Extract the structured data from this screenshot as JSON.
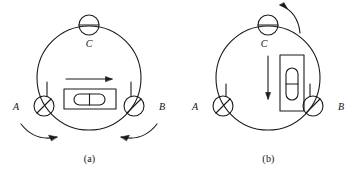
{
  "figure": {
    "type": "technical-diagram",
    "panels": [
      {
        "id": "a",
        "caption": "(a)",
        "footscrews": [
          {
            "label": "A",
            "position": "lower-left",
            "slot": "diagonal"
          },
          {
            "label": "B",
            "position": "lower-right",
            "slot": "diagonal"
          },
          {
            "label": "C",
            "position": "top",
            "slot": "horizontal"
          }
        ],
        "level": {
          "orientation": "horizontal",
          "description": "plate bubble vial aligned parallel to the line AB",
          "bubble_divider": "center-line"
        },
        "arrows": [
          {
            "name": "level-axis-arrow",
            "kind": "straight",
            "direction": "right"
          },
          {
            "name": "footscrew-a-rotation-arrow",
            "kind": "curved",
            "direction": "clockwise-inward"
          },
          {
            "name": "footscrew-b-rotation-arrow",
            "kind": "curved",
            "direction": "counterclockwise-inward"
          }
        ]
      },
      {
        "id": "b",
        "caption": "(b)",
        "footscrews": [
          {
            "label": "A",
            "position": "lower-left",
            "slot": "diagonal"
          },
          {
            "label": "B",
            "position": "lower-right",
            "slot": "diagonal"
          },
          {
            "label": "C",
            "position": "top",
            "slot": "horizontal"
          }
        ],
        "level": {
          "orientation": "vertical",
          "description": "plate bubble vial rotated 90 degrees, perpendicular to the line AB",
          "bubble_divider": "center-line"
        },
        "arrows": [
          {
            "name": "level-axis-arrow",
            "kind": "straight",
            "direction": "down"
          },
          {
            "name": "footscrew-c-rotation-arrow",
            "kind": "curved",
            "direction": "counterclockwise"
          }
        ]
      }
    ]
  },
  "labels": {
    "a_point": "A",
    "b_point": "B",
    "c_point": "C"
  },
  "captions": {
    "panel_a": "(a)",
    "panel_b": "(b)"
  },
  "colors": {
    "stroke": "#1a1a1a",
    "background": "#ffffff",
    "text": "#111111"
  }
}
